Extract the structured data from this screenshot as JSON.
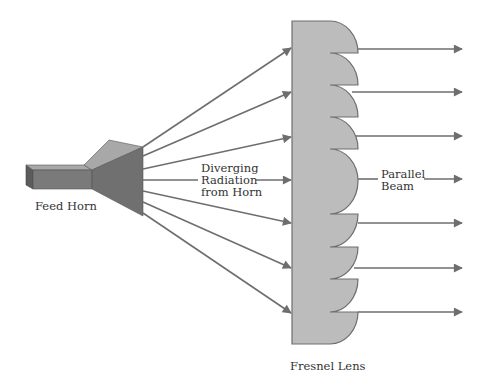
{
  "diagram": {
    "colors": {
      "background": "#ffffff",
      "lens_fill": "#bcbcbc",
      "lens_stroke": "#6e6e6e",
      "arrow": "#6e6e6e",
      "horn_front": "#7a7a7a",
      "horn_top": "#a8a8a8",
      "horn_end": "#5c5c5c",
      "text": "#333333"
    },
    "labels": {
      "feed_horn": "Feed Horn",
      "diverging_line1": "Diverging",
      "diverging_line2": "Radiation",
      "diverging_line3": "from Horn",
      "parallel_line1": "Parallel",
      "parallel_line2": "Beam",
      "fresnel_lens": "Fresnel Lens"
    },
    "components": [
      {
        "id": "feed-horn",
        "label": "Feed Horn"
      },
      {
        "id": "fresnel-lens",
        "label": "Fresnel Lens",
        "zones": 7
      },
      {
        "id": "diverging-rays",
        "label": "Diverging Radiation from Horn",
        "count": 7
      },
      {
        "id": "parallel-beam",
        "label": "Parallel Beam",
        "count": 7
      }
    ]
  }
}
